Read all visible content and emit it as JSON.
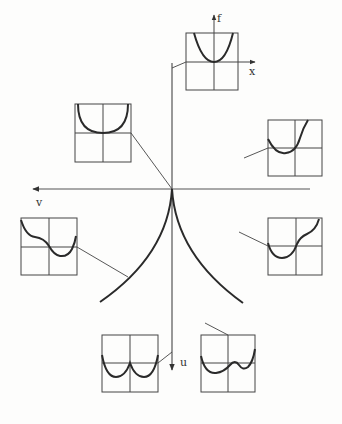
{
  "diagram": {
    "type": "cusp catastrophe bifurcation diagram",
    "colors": {
      "ink": "#2a2a2a",
      "axis": "#555555",
      "background": "#fdfdfc"
    },
    "axes": {
      "control_horizontal_label": "v",
      "control_vertical_label": "u",
      "inset_vertical_label": "f",
      "inset_horizontal_label": "x"
    },
    "cusp": {
      "apex": [
        172,
        189
      ],
      "left_end": [
        100,
        302
      ],
      "right_end": [
        243,
        303
      ]
    },
    "insets": [
      {
        "id": "top",
        "shape": "single-well (parabola)",
        "box": [
          186,
          33,
          52,
          57
        ]
      },
      {
        "id": "upper-left",
        "shape": "flat-bottom single well",
        "box": [
          75,
          104,
          56,
          58
        ]
      },
      {
        "id": "upper-right",
        "shape": "tilted single well",
        "box": [
          268,
          120,
          54,
          56
        ]
      },
      {
        "id": "left",
        "shape": "asymmetric well with shoulder (left)",
        "box": [
          21,
          218,
          56,
          57
        ]
      },
      {
        "id": "lower-right",
        "shape": "asymmetric well with shoulder (right)",
        "box": [
          268,
          218,
          54,
          57
        ]
      },
      {
        "id": "bottom-left",
        "shape": "symmetric double well",
        "box": [
          102,
          335,
          56,
          57
        ]
      },
      {
        "id": "bottom-right",
        "shape": "asymmetric double well",
        "box": [
          201,
          335,
          54,
          57
        ]
      }
    ]
  }
}
